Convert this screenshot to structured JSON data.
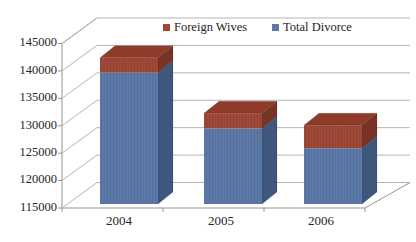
{
  "chart_data": {
    "type": "bar",
    "subtype": "3d-stacked-column",
    "title": "",
    "xlabel": "",
    "ylabel": "",
    "categories": [
      "2004",
      "2005",
      "2006"
    ],
    "series": [
      {
        "name": "Total Divorce",
        "values": [
          139700,
          129500,
          125900
        ],
        "color": "#5d79a8"
      },
      {
        "name": "Foreign Wives",
        "values": [
          2700,
          2800,
          4200
        ],
        "color": "#9e4937"
      }
    ],
    "stack_order_bottom_to_top": [
      "Total Divorce",
      "Foreign Wives"
    ],
    "legend": [
      {
        "label": "Foreign Wives",
        "color": "#9e4937"
      },
      {
        "label": "Total Divorce",
        "color": "#5d79a8"
      }
    ],
    "legend_position": "top",
    "grid": true,
    "ylim": [
      115000,
      145000
    ],
    "ytick_step": 5000,
    "yticks": [
      "145000",
      "140000",
      "135000",
      "130000",
      "125000",
      "120000",
      "115000"
    ],
    "colors_3d": {
      "blue_front": "#5d79a8",
      "blue_stripe": "#54709c",
      "blue_side": "#3f577d",
      "red_front": "#9e4937",
      "red_stripe": "#934334",
      "red_top": "#8e3b2a",
      "red_side": "#773325",
      "gridline": "#b5b5b5",
      "axis": "#959595",
      "text": "#262626"
    }
  }
}
